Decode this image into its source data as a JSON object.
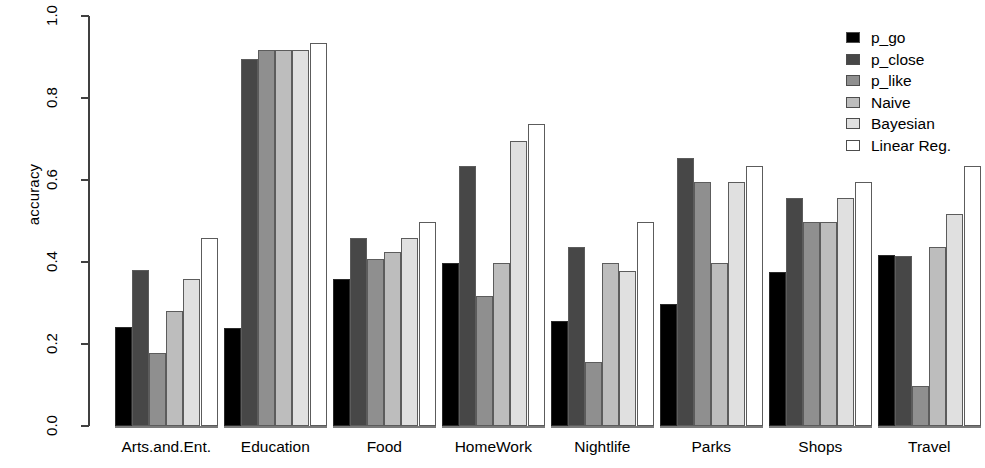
{
  "chart_data": {
    "type": "bar",
    "title": "",
    "xlabel": "",
    "ylabel": "accuracy",
    "ylim": [
      0.0,
      1.0
    ],
    "ytick_labels": [
      "0.0",
      "0.2",
      "0.4",
      "0.6",
      "0.8",
      "1.0"
    ],
    "ytick_values": [
      0.0,
      0.2,
      0.4,
      0.6,
      0.8,
      1.0
    ],
    "grid": false,
    "legend_position": "top-right",
    "categories": [
      "Arts.and.Ent.",
      "Education",
      "Food",
      "HomeWork",
      "Nightlife",
      "Parks",
      "Shops",
      "Travel"
    ],
    "series": [
      {
        "name": "p_go",
        "color": "#000000",
        "values": [
          0.241,
          0.24,
          0.358,
          0.398,
          0.257,
          0.297,
          0.375,
          0.417
        ]
      },
      {
        "name": "p_close",
        "color": "#474747",
        "values": [
          0.381,
          0.895,
          0.458,
          0.635,
          0.437,
          0.653,
          0.555,
          0.415
        ]
      },
      {
        "name": "p_like",
        "color": "#8f8f8f",
        "values": [
          0.179,
          0.918,
          0.408,
          0.318,
          0.157,
          0.596,
          0.497,
          0.097
        ]
      },
      {
        "name": "Naive",
        "color": "#bdbdbd",
        "values": [
          0.281,
          0.918,
          0.424,
          0.398,
          0.398,
          0.398,
          0.497,
          0.437
        ]
      },
      {
        "name": "Bayesian",
        "color": "#e0e0e0",
        "values": [
          0.359,
          0.918,
          0.458,
          0.696,
          0.378,
          0.596,
          0.555,
          0.516
        ]
      },
      {
        "name": "Linear Reg.",
        "color": "#ffffff",
        "values": [
          0.459,
          0.935,
          0.497,
          0.737,
          0.497,
          0.633,
          0.594,
          0.633
        ]
      }
    ]
  }
}
